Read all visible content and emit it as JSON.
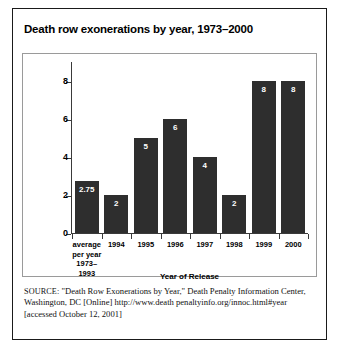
{
  "figure": {
    "title": "Death row exonerations by year, 1973–2000",
    "source_label": "SOURCE:",
    "source_text": " \"Death Row Exonerations by Year,\" Death Penalty Information Center, Washington, DC [Online] http://www.death penaltyinfo.org/innoc.html#year [accessed October 12, 2001]"
  },
  "chart_data": {
    "type": "bar",
    "title": "Death row exonerations by year, 1973–2000",
    "xlabel": "Year of Release",
    "ylabel": "Number of Inmates Released",
    "categories": [
      "average per year 1973–1993",
      "1994",
      "1995",
      "1996",
      "1997",
      "1998",
      "1999",
      "2000"
    ],
    "category_lines": [
      [
        "average",
        "per year",
        "1973–1993"
      ],
      [
        "1994"
      ],
      [
        "1995"
      ],
      [
        "1996"
      ],
      [
        "1997"
      ],
      [
        "1998"
      ],
      [
        "1999"
      ],
      [
        "2000"
      ]
    ],
    "values": [
      2.75,
      2,
      5,
      6,
      4,
      2,
      8,
      8
    ],
    "value_labels": [
      "2.75",
      "2",
      "5",
      "6",
      "4",
      "2",
      "8",
      "8"
    ],
    "ylim": [
      0,
      9
    ],
    "yticks": [
      0,
      2,
      4,
      6,
      8
    ],
    "ytick_labels": [
      "0",
      "2",
      "4",
      "6",
      "8"
    ],
    "grid": false,
    "legend": false,
    "bar_color": "#2e2e2e",
    "value_label_color": "#ffffff",
    "axis_color": "#3a3a3a",
    "background": "#ffffff"
  }
}
